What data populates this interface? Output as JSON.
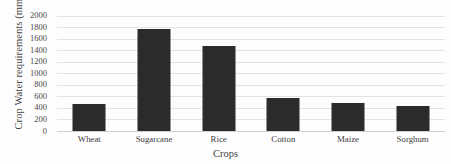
{
  "chart_data": {
    "type": "bar",
    "title": "",
    "xlabel": "Crops",
    "ylabel": "Crop Water requirements (mm)",
    "categories": [
      "Wheat",
      "Sugarcane",
      "Rice",
      "Cotton",
      "Maize",
      "Sorghum"
    ],
    "values": [
      465,
      1770,
      1470,
      580,
      490,
      440
    ],
    "ylim": [
      0,
      2000
    ],
    "ytick_labels": [
      "2000",
      "1800",
      "1600",
      "1400",
      "1200",
      "1000",
      "800",
      "600",
      "400",
      "200",
      "0"
    ],
    "ytick_values": [
      2000,
      1800,
      1600,
      1400,
      1200,
      1000,
      800,
      600,
      400,
      200,
      0
    ],
    "ytick_step": 200,
    "grid": true,
    "grid_axis": "y",
    "legend": false,
    "legend_position": "none",
    "series": [
      {
        "name": "Crop Water requirements (mm)",
        "values": [
          465,
          1770,
          1470,
          580,
          490,
          440
        ],
        "color": "#2b2b2b"
      }
    ]
  },
  "colors": {
    "bar": "#2b2b2b",
    "gridline": "#e3e3e3",
    "axis_line": "#cfcfcf",
    "text": "#3f3f3f",
    "background": "#fdfdfd"
  }
}
